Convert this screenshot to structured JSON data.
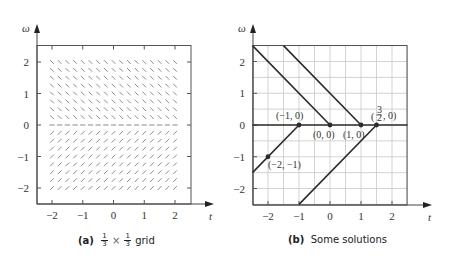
{
  "chart_data": [
    {
      "type": "slope-field",
      "panel": "a",
      "title": "",
      "caption_label": "(a)",
      "caption_text": "1/3 × 1/3 grid",
      "caption_frac_num": "1",
      "caption_frac_den": "3",
      "caption_times": "×",
      "caption_word": "grid",
      "xlabel": "t",
      "ylabel": "ω",
      "xlim": [
        -2.5,
        2.5
      ],
      "ylim": [
        -2.5,
        2.5
      ],
      "xticks": [
        -2,
        -1,
        0,
        1,
        2
      ],
      "yticks": [
        -2,
        -1,
        0,
        1,
        2
      ],
      "grid": false,
      "field": {
        "t_range": [
          -2,
          2
        ],
        "w_range": [
          -2,
          2
        ],
        "step": 0.25,
        "slope_rule": "dω/dt = -1 for ω > 0, 0 for ω = 0, +1 for ω < 0"
      }
    },
    {
      "type": "line",
      "panel": "b",
      "caption_label": "(b)",
      "caption_text": "Some solutions",
      "xlabel": "t",
      "ylabel": "ω",
      "xlim": [
        -2.5,
        2.5
      ],
      "ylim": [
        -2.5,
        2.5
      ],
      "xticks": [
        -2,
        -1,
        0,
        1,
        2
      ],
      "yticks": [
        -2,
        -1,
        0,
        1,
        2
      ],
      "grid": true,
      "grid_step": 0.5,
      "series": [
        {
          "name": "solution through (0,0) from above",
          "points": [
            [
              -2.5,
              2.5
            ],
            [
              0,
              0
            ]
          ]
        },
        {
          "name": "solution through (1,0) from above",
          "points": [
            [
              -1.5,
              2.5
            ],
            [
              1,
              0
            ]
          ]
        },
        {
          "name": "equilibrium ω = 0",
          "points": [
            [
              -2.5,
              0
            ],
            [
              2.5,
              0
            ]
          ]
        },
        {
          "name": "solution through (-2,-1) and (-1,0)",
          "points": [
            [
              -2.5,
              -1.5
            ],
            [
              -1,
              0
            ]
          ]
        },
        {
          "name": "solution through (3/2,0) from below",
          "points": [
            [
              -1,
              -2.5
            ],
            [
              1.5,
              0
            ]
          ]
        }
      ],
      "marked_points": [
        {
          "label": "(−1, 0)",
          "t": -1,
          "w": 0
        },
        {
          "label": "(0, 0)",
          "t": 0,
          "w": 0
        },
        {
          "label": "(1, 0)",
          "t": 1,
          "w": 0
        },
        {
          "label": "(3/2, 0)",
          "t": 1.5,
          "w": 0
        },
        {
          "label": "(−2, −1)",
          "t": -2,
          "w": -1
        }
      ]
    }
  ],
  "panels": {
    "a": {
      "caption_label": "(a)",
      "frac_num": "1",
      "frac_den": "3",
      "times": "×",
      "word": "grid"
    },
    "b": {
      "caption_label": "(b)",
      "caption_text": "Some solutions"
    }
  },
  "axes": {
    "x_label": "t",
    "y_label": "ω",
    "tick_labels": [
      "−2",
      "−1",
      "0",
      "1",
      "2"
    ]
  },
  "labels": {
    "p_m1_0": "(−1, 0)",
    "p_0_0": "(0, 0)",
    "p_1_0": "(1, 0)",
    "p_32_0_paren_open": "(",
    "p_32_0_num": "3",
    "p_32_0_den": "2",
    "p_32_0_rest": ", 0)",
    "p_m2_m1": "(−2, −1)"
  },
  "colors": {
    "ink": "#333333",
    "grid": "#c8c8c8",
    "field_mark": "#8a8a8a",
    "solution": "#2b2b2b"
  }
}
